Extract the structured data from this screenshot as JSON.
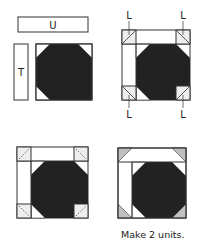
{
  "diagram": {
    "step1": {
      "strip_top_label": "U",
      "strip_side_label": "T"
    },
    "step2": {
      "corner_labels": [
        "L",
        "L",
        "L",
        "L"
      ]
    },
    "step4": {
      "caption": "Make 2 units."
    }
  },
  "colors": {
    "dark_fabric": "#222222",
    "light_fabric": "#ffffff",
    "corner_fabric": "#c0c0c0",
    "outline": "#333333"
  }
}
